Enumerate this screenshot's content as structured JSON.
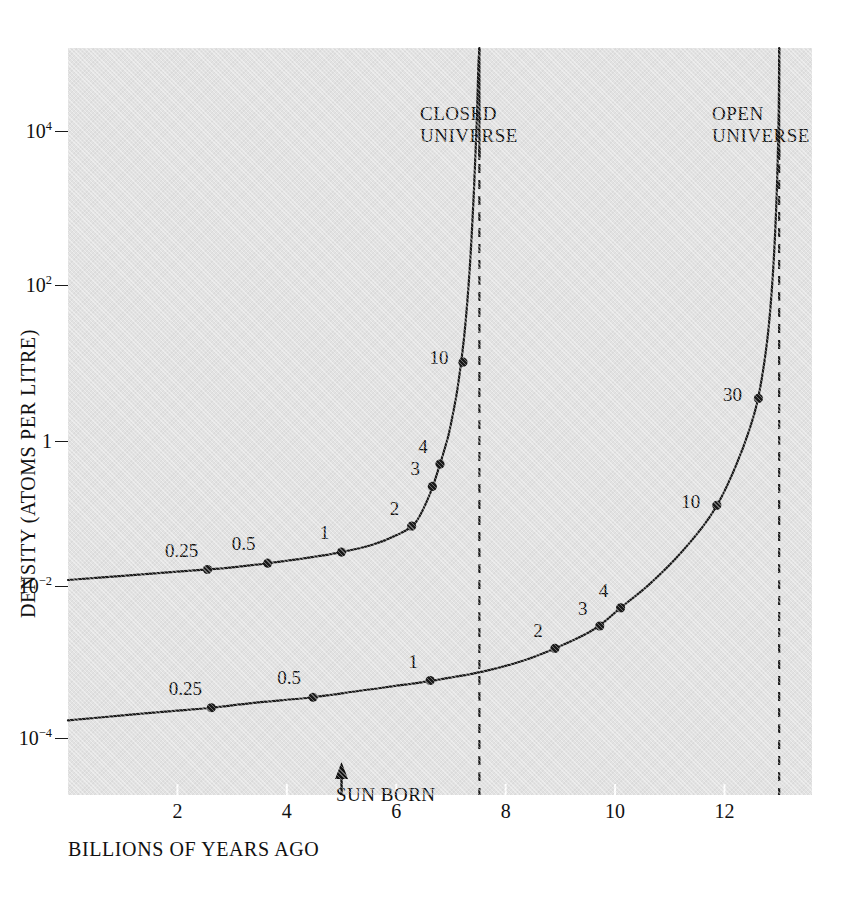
{
  "chart_data": {
    "type": "line",
    "title": "",
    "xlabel": "BILLIONS OF YEARS AGO",
    "ylabel": "DENSITY (ATOMS PER LITRE)",
    "xlim": [
      0,
      13.6
    ],
    "ylim_log10": [
      -5.1,
      5.6
    ],
    "grid": false,
    "legend_position": "in-plot annotations",
    "x_ticks": [
      {
        "value": 2,
        "label": "2"
      },
      {
        "value": 4,
        "label": "4"
      },
      {
        "value": 6,
        "label": "6"
      },
      {
        "value": 8,
        "label": "8"
      },
      {
        "value": 10,
        "label": "10"
      },
      {
        "value": 12,
        "label": "12"
      }
    ],
    "y_ticks": [
      {
        "exponent": 4,
        "mantissa": "10",
        "sup": "4",
        "label": "10^4"
      },
      {
        "exponent": 2,
        "mantissa": "10",
        "sup": "2",
        "label": "10^2"
      },
      {
        "exponent": 0,
        "mantissa": "1",
        "sup": "",
        "label": "1"
      },
      {
        "exponent": -2,
        "mantissa": "10",
        "sup": "−2",
        "label": "10^-2"
      },
      {
        "exponent": -4,
        "mantissa": "10",
        "sup": "−4",
        "label": "10^-4"
      }
    ],
    "series": [
      {
        "name": "CLOSED UNIVERSE",
        "asymptote_x": 7.52,
        "curve": [
          {
            "x": 0.0,
            "y_log10": -2.02
          },
          {
            "x": 1.0,
            "y_log10": -1.96
          },
          {
            "x": 2.0,
            "y_log10": -1.9
          },
          {
            "x": 2.55,
            "y_log10": -1.87
          },
          {
            "x": 3.0,
            "y_log10": -1.84
          },
          {
            "x": 3.65,
            "y_log10": -1.78
          },
          {
            "x": 4.4,
            "y_log10": -1.7
          },
          {
            "x": 5.0,
            "y_log10": -1.62
          },
          {
            "x": 5.55,
            "y_log10": -1.52
          },
          {
            "x": 6.0,
            "y_log10": -1.38
          },
          {
            "x": 6.35,
            "y_log10": -1.2
          },
          {
            "x": 6.62,
            "y_log10": -0.78
          },
          {
            "x": 6.8,
            "y_log10": -0.36
          },
          {
            "x": 6.9,
            "y_log10": -0.1
          },
          {
            "x": 6.98,
            "y_log10": 0.14
          },
          {
            "x": 7.12,
            "y_log10": 0.72
          },
          {
            "x": 7.24,
            "y_log10": 1.45
          },
          {
            "x": 7.34,
            "y_log10": 2.4
          },
          {
            "x": 7.42,
            "y_log10": 3.55
          },
          {
            "x": 7.47,
            "y_log10": 4.5
          },
          {
            "x": 7.5,
            "y_log10": 5.3
          },
          {
            "x": 7.52,
            "y_log10": 5.6
          }
        ],
        "points": [
          {
            "label": "0.25",
            "x": 2.55,
            "y_log10": -1.87,
            "label_dx": -26,
            "label_dy": -20
          },
          {
            "label": "0.5",
            "x": 3.65,
            "y_log10": -1.78,
            "label_dx": -24,
            "label_dy": -20
          },
          {
            "label": "1",
            "x": 5.0,
            "y_log10": -1.62,
            "label_dx": -17,
            "label_dy": -20
          },
          {
            "label": "2",
            "x": 6.28,
            "y_log10": -1.25,
            "label_dx": -17,
            "label_dy": -18
          },
          {
            "label": "3",
            "x": 6.66,
            "y_log10": -0.68,
            "label_dx": -17,
            "label_dy": -18
          },
          {
            "label": "4",
            "x": 6.8,
            "y_log10": -0.36,
            "label_dx": -17,
            "label_dy": -18
          },
          {
            "label": "10",
            "x": 7.22,
            "y_log10": 1.1,
            "label_dx": -24,
            "label_dy": -5
          }
        ]
      },
      {
        "name": "OPEN UNIVERSE",
        "asymptote_x": 13.0,
        "curve": [
          {
            "x": 0.0,
            "y_log10": -4.03
          },
          {
            "x": 1.0,
            "y_log10": -3.96
          },
          {
            "x": 2.0,
            "y_log10": -3.89
          },
          {
            "x": 2.62,
            "y_log10": -3.85
          },
          {
            "x": 3.4,
            "y_log10": -3.78
          },
          {
            "x": 4.48,
            "y_log10": -3.7
          },
          {
            "x": 5.4,
            "y_log10": -3.6
          },
          {
            "x": 6.6,
            "y_log10": -3.47
          },
          {
            "x": 7.6,
            "y_log10": -3.33
          },
          {
            "x": 8.3,
            "y_log10": -3.18
          },
          {
            "x": 8.9,
            "y_log10": -3.0
          },
          {
            "x": 9.5,
            "y_log10": -2.78
          },
          {
            "x": 9.8,
            "y_log10": -2.62
          },
          {
            "x": 10.1,
            "y_log10": -2.42
          },
          {
            "x": 10.6,
            "y_log10": -2.1
          },
          {
            "x": 11.1,
            "y_log10": -1.72
          },
          {
            "x": 11.6,
            "y_log10": -1.26
          },
          {
            "x": 11.9,
            "y_log10": -0.9
          },
          {
            "x": 12.2,
            "y_log10": -0.4
          },
          {
            "x": 12.45,
            "y_log10": 0.12
          },
          {
            "x": 12.62,
            "y_log10": 0.6
          },
          {
            "x": 12.78,
            "y_log10": 1.4
          },
          {
            "x": 12.88,
            "y_log10": 2.3
          },
          {
            "x": 12.95,
            "y_log10": 3.4
          },
          {
            "x": 12.99,
            "y_log10": 4.6
          },
          {
            "x": 13.0,
            "y_log10": 5.6
          }
        ],
        "points": [
          {
            "label": "0.25",
            "x": 2.62,
            "y_log10": -3.85,
            "label_dx": -26,
            "label_dy": -20
          },
          {
            "label": "0.5",
            "x": 4.48,
            "y_log10": -3.7,
            "label_dx": -24,
            "label_dy": -20
          },
          {
            "label": "1",
            "x": 6.62,
            "y_log10": -3.46,
            "label_dx": -17,
            "label_dy": -20
          },
          {
            "label": "2",
            "x": 8.9,
            "y_log10": -3.0,
            "label_dx": -17,
            "label_dy": -18
          },
          {
            "label": "3",
            "x": 9.72,
            "y_log10": -2.68,
            "label_dx": -17,
            "label_dy": -18
          },
          {
            "label": "4",
            "x": 10.1,
            "y_log10": -2.42,
            "label_dx": -17,
            "label_dy": -18
          },
          {
            "label": "10",
            "x": 11.86,
            "y_log10": -0.95,
            "label_dx": -26,
            "label_dy": -4
          },
          {
            "label": "30",
            "x": 12.62,
            "y_log10": 0.58,
            "label_dx": -26,
            "label_dy": -4
          }
        ]
      }
    ],
    "annotations": [
      {
        "name": "closed-universe-title",
        "line1": "CLOSED",
        "line2": "UNIVERSE"
      },
      {
        "name": "open-universe-title",
        "line1": "OPEN",
        "line2": "UNIVERSE"
      },
      {
        "name": "sun-born",
        "text": "SUN BORN",
        "x": 5.0,
        "arrow": "up"
      }
    ]
  },
  "colors": {
    "panel_background": "#e2e2e2",
    "page_background": "#ffffff",
    "ink": "#111111",
    "curve": "#1a1a1a",
    "asymptote": "#1a1a1a"
  }
}
